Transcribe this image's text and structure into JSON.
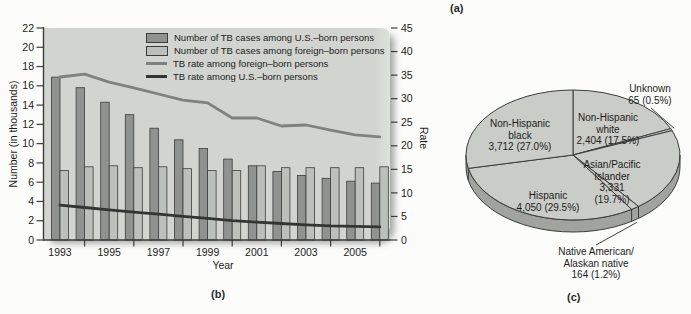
{
  "page": {
    "section_labels": {
      "a": "(a)",
      "b": "(b)",
      "c": "(c)"
    }
  },
  "colors": {
    "plot_bg": "#d2d4d0",
    "plot_bg_edge": "#dfe1dd",
    "us_bar": "#8f938f",
    "fb_bar": "#bcc0ba",
    "fb_rate_line": "#7e827e",
    "us_rate_line": "#343434",
    "outline": "#3c3c3c",
    "pie_face": "#caccc7",
    "pie_side": "#a0a39e",
    "text": "#1c1c1c"
  },
  "chart_data": [
    {
      "type": "bar",
      "title": "",
      "years": [
        1993,
        1994,
        1995,
        1996,
        1997,
        1998,
        1999,
        2000,
        2001,
        2002,
        2003,
        2004,
        2005,
        2006
      ],
      "x_tick_labels": [
        "1993",
        "1995",
        "1997",
        "1999",
        "2001",
        "2003",
        "2005"
      ],
      "xlabel": "Year",
      "left_axis": {
        "label": "Number (in thousands)",
        "min": 0,
        "max": 22,
        "step": 2
      },
      "right_axis": {
        "label": "Rate",
        "min": 0,
        "max": 45,
        "step": 5
      },
      "legend_position": "top-center",
      "grid": false,
      "series": [
        {
          "name": "Number of TB cases among U.S.–born persons",
          "type": "bar",
          "axis": "left",
          "values": [
            16.9,
            15.8,
            14.3,
            13.0,
            11.6,
            10.4,
            9.5,
            8.4,
            7.7,
            7.1,
            6.7,
            6.4,
            6.1,
            5.9
          ]
        },
        {
          "name": "Number of TB cases among foreign–born persons",
          "type": "bar",
          "axis": "left",
          "values": [
            7.2,
            7.6,
            7.7,
            7.5,
            7.6,
            7.4,
            7.2,
            7.2,
            7.7,
            7.5,
            7.5,
            7.5,
            7.5,
            7.6
          ]
        },
        {
          "name": "TB rate among foreign–born persons",
          "type": "line",
          "axis": "right",
          "values": [
            34.6,
            35.2,
            33.5,
            32.3,
            31.0,
            29.7,
            29.1,
            25.9,
            25.9,
            24.2,
            24.4,
            23.3,
            22.3,
            21.9
          ]
        },
        {
          "name": "TB rate among U.S.–born persons",
          "type": "line",
          "axis": "right",
          "values": [
            7.4,
            6.9,
            6.4,
            5.9,
            5.5,
            5.0,
            4.6,
            4.1,
            3.8,
            3.5,
            3.2,
            3.0,
            2.9,
            2.8
          ]
        }
      ]
    },
    {
      "type": "pie",
      "three_d": true,
      "start_angle_deg": 90,
      "direction": "clockwise",
      "slices": [
        {
          "label": "Non-Hispanic white",
          "value": 2404,
          "pct": 17.5,
          "label_lines": [
            "Non-Hispanic",
            "white",
            "2,404 (17.5%)"
          ]
        },
        {
          "label": "Unknown",
          "value": 65,
          "pct": 0.5,
          "label_lines": [
            "Unknown",
            "65 (0.5%)"
          ]
        },
        {
          "label": "Asian/Pacific Islander",
          "value": 3331,
          "pct": 19.7,
          "label_lines": [
            "Asian/Pacific",
            "Islander",
            "3,331",
            "(19.7%)"
          ]
        },
        {
          "label": "Native American/Alaskan native",
          "value": 164,
          "pct": 1.2,
          "label_lines": [
            "Native American/",
            "Alaskan native",
            "164 (1.2%)"
          ]
        },
        {
          "label": "Hispanic",
          "value": 4050,
          "pct": 29.5,
          "label_lines": [
            "Hispanic",
            "4,050 (29.5%)"
          ]
        },
        {
          "label": "Non-Hispanic black",
          "value": 3712,
          "pct": 27.0,
          "label_lines": [
            "Non-Hispanic",
            "black",
            "3,712 (27.0%)"
          ]
        }
      ]
    }
  ]
}
